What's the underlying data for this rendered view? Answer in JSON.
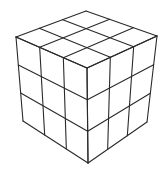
{
  "diagram": {
    "grid_size": 3,
    "stroke_color": "#2a2a2a",
    "background_color": "#ffffff",
    "vertices": {
      "top": [
        86,
        11
      ],
      "left_top": [
        16,
        37
      ],
      "right_top": [
        157,
        36
      ],
      "front_top": [
        87,
        68
      ],
      "left_bottom": [
        23,
        121
      ],
      "right_bottom": [
        147,
        122
      ],
      "front_bottom": [
        88,
        163
      ]
    },
    "faces": [
      {
        "name": "top",
        "corners": [
          "left_top",
          "top",
          "right_top",
          "front_top"
        ]
      },
      {
        "name": "left",
        "corners": [
          "left_top",
          "front_top",
          "front_bottom",
          "left_bottom"
        ]
      },
      {
        "name": "right",
        "corners": [
          "front_top",
          "right_top",
          "right_bottom",
          "front_bottom"
        ]
      }
    ]
  }
}
